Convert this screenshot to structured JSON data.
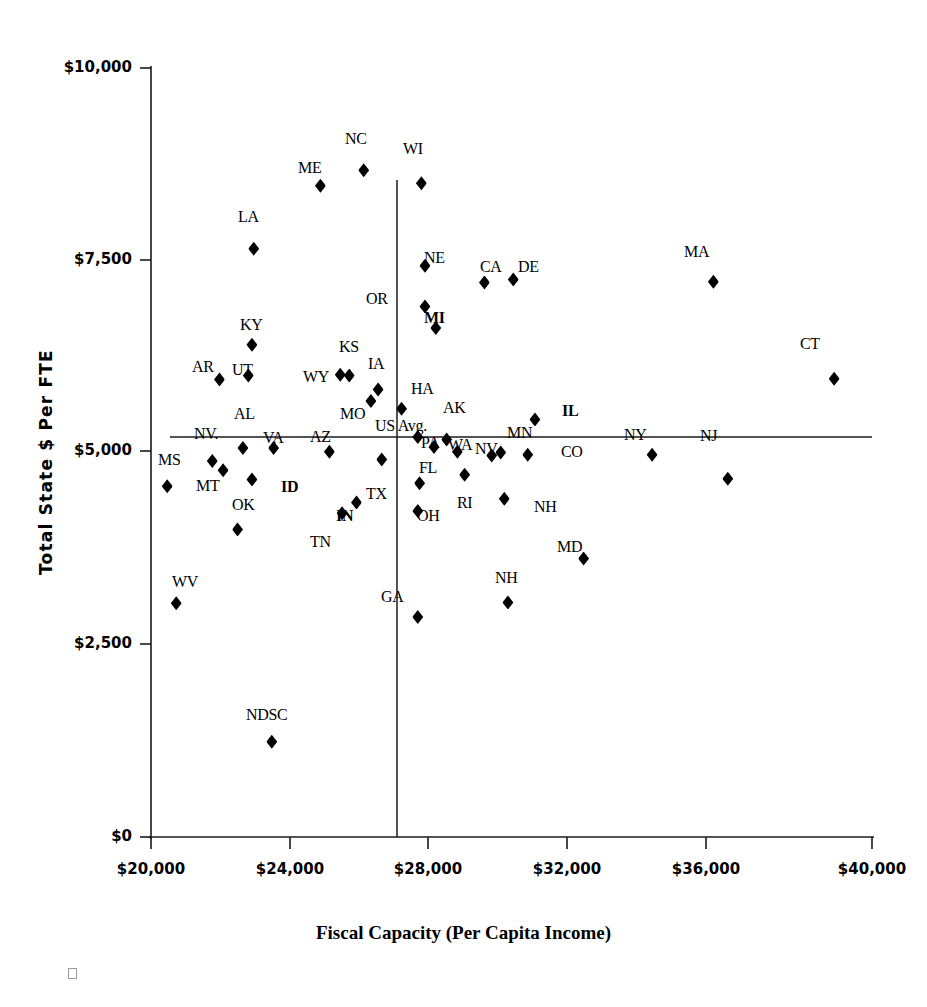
{
  "chart_data": {
    "type": "scatter",
    "title": "",
    "xlabel": "Fiscal Capacity (Per Capita Income)",
    "ylabel": "Total State $ Per FTE",
    "xlim": [
      20000,
      40000
    ],
    "ylim": [
      0,
      10000
    ],
    "xticks": [
      "$20,000",
      "$24,000",
      "$28,000",
      "$32,000",
      "$36,000",
      "$40,000"
    ],
    "xtick_values": [
      20000,
      24000,
      28000,
      32000,
      36000,
      40000
    ],
    "yticks": [
      "$0",
      "$2,500",
      "$5,000",
      "$7,500",
      "$10,000"
    ],
    "ytick_values": [
      0,
      2500,
      5000,
      7500,
      10000
    ],
    "grid": false,
    "legend": "none",
    "reference_lines": {
      "vertical_x": 27400,
      "horizontal_y": 5200,
      "note": "US Avg. crosshair"
    },
    "points": [
      {
        "label": "MS",
        "x": 20450,
        "y": 4560
      },
      {
        "label": "WV",
        "x": 20700,
        "y": 3040
      },
      {
        "label": "MT",
        "x": 21700,
        "y": 4890
      },
      {
        "label": "AR",
        "x": 21900,
        "y": 5950
      },
      {
        "label": "NV",
        "x": 22000,
        "y": 4770
      },
      {
        "label": "OK",
        "x": 22400,
        "y": 4000
      },
      {
        "label": "AL",
        "x": 22550,
        "y": 5060
      },
      {
        "label": "UT",
        "x": 22700,
        "y": 6000
      },
      {
        "label": "ID",
        "x": 22800,
        "y": 4650
      },
      {
        "label": "KY",
        "x": 22800,
        "y": 6400
      },
      {
        "label": "LA",
        "x": 22850,
        "y": 7650
      },
      {
        "label": "NDSC",
        "x": 23350,
        "y": 1240
      },
      {
        "label": "VA",
        "x": 23400,
        "y": 5060
      },
      {
        "label": "ME",
        "x": 24700,
        "y": 8470
      },
      {
        "label": "AZ",
        "x": 24950,
        "y": 5010
      },
      {
        "label": "WY",
        "x": 25250,
        "y": 6010
      },
      {
        "label": "TN",
        "x": 25300,
        "y": 4210
      },
      {
        "label": "KS",
        "x": 25500,
        "y": 6000
      },
      {
        "label": "IN",
        "x": 25700,
        "y": 4350
      },
      {
        "label": "NC",
        "x": 25900,
        "y": 8670
      },
      {
        "label": "MO",
        "x": 26100,
        "y": 5670
      },
      {
        "label": "IA",
        "x": 26300,
        "y": 5820
      },
      {
        "label": "TX",
        "x": 26400,
        "y": 4910
      },
      {
        "label": "HA",
        "x": 26950,
        "y": 5570
      },
      {
        "label": "US Avg.",
        "x": 27400,
        "y": 5200
      },
      {
        "label": "OH",
        "x": 27400,
        "y": 4240
      },
      {
        "label": "GA",
        "x": 27400,
        "y": 2860
      },
      {
        "label": "FL",
        "x": 27450,
        "y": 4600
      },
      {
        "label": "WI",
        "x": 27500,
        "y": 8500
      },
      {
        "label": "NE",
        "x": 27600,
        "y": 7430
      },
      {
        "label": "OR",
        "x": 27600,
        "y": 6900
      },
      {
        "label": "PA",
        "x": 27850,
        "y": 5070
      },
      {
        "label": "MI",
        "x": 27900,
        "y": 6620
      },
      {
        "label": "AK",
        "x": 28200,
        "y": 5170
      },
      {
        "label": "WA",
        "x": 28500,
        "y": 5010
      },
      {
        "label": "RI",
        "x": 28700,
        "y": 4710
      },
      {
        "label": "CA",
        "x": 29250,
        "y": 7210
      },
      {
        "label": "NV",
        "x": 29450,
        "y": 4960
      },
      {
        "label": "MN",
        "x": 29700,
        "y": 5000
      },
      {
        "label": "NH",
        "x": 29800,
        "y": 4400
      },
      {
        "label": "DE",
        "x": 30050,
        "y": 7250
      },
      {
        "label": "NM",
        "x": 29900,
        "y": 3050
      },
      {
        "label": "CO",
        "x": 30450,
        "y": 4970
      },
      {
        "label": "IL",
        "x": 30650,
        "y": 5430
      },
      {
        "label": "MD",
        "x": 32000,
        "y": 3620
      },
      {
        "label": "NY",
        "x": 33900,
        "y": 4970
      },
      {
        "label": "NJ",
        "x": 36000,
        "y": 4660
      },
      {
        "label": "MA",
        "x": 35600,
        "y": 7220
      },
      {
        "label": "CT",
        "x": 38950,
        "y": 5960
      }
    ]
  },
  "labels_placement": [
    {
      "text": "MS",
      "lx": 158,
      "ly": 452,
      "bold": false
    },
    {
      "text": "MT",
      "lx": 196,
      "ly": 478,
      "bold": false
    },
    {
      "text": "WV",
      "lx": 172,
      "ly": 574,
      "bold": false
    },
    {
      "text": "AR",
      "lx": 192,
      "ly": 359,
      "bold": false
    },
    {
      "text": "NV.",
      "lx": 194,
      "ly": 426,
      "bold": false
    },
    {
      "text": "AL",
      "lx": 234,
      "ly": 406,
      "bold": false
    },
    {
      "text": "UT",
      "lx": 232,
      "ly": 362,
      "bold": false
    },
    {
      "text": "KY",
      "lx": 240,
      "ly": 317,
      "bold": false
    },
    {
      "text": "LA",
      "lx": 238,
      "ly": 209,
      "bold": false
    },
    {
      "text": "OK",
      "lx": 232,
      "ly": 497,
      "bold": false
    },
    {
      "text": "ID",
      "lx": 281,
      "ly": 479,
      "bold": true
    },
    {
      "text": "VA",
      "lx": 263,
      "ly": 430,
      "bold": false
    },
    {
      "text": "NDSC",
      "lx": 246,
      "ly": 707,
      "bold": false
    },
    {
      "text": "AZ",
      "lx": 310,
      "ly": 429,
      "bold": false
    },
    {
      "text": "ME",
      "lx": 298,
      "ly": 160,
      "bold": false
    },
    {
      "text": "WY",
      "lx": 303,
      "ly": 369,
      "bold": false
    },
    {
      "text": "TN",
      "lx": 310,
      "ly": 534,
      "bold": false
    },
    {
      "text": "KS",
      "lx": 339,
      "ly": 339,
      "bold": false
    },
    {
      "text": "IN",
      "lx": 336,
      "ly": 508,
      "bold": true
    },
    {
      "text": "NC",
      "lx": 345,
      "ly": 131,
      "bold": false
    },
    {
      "text": "MO",
      "lx": 340,
      "ly": 406,
      "bold": false
    },
    {
      "text": "IA",
      "lx": 368,
      "ly": 356,
      "bold": false
    },
    {
      "text": "TX",
      "lx": 366,
      "ly": 486,
      "bold": false
    },
    {
      "text": "WI",
      "lx": 403,
      "ly": 141,
      "bold": false
    },
    {
      "text": "HA",
      "lx": 411,
      "ly": 381,
      "bold": false
    },
    {
      "text": "US Avg.",
      "lx": 375,
      "ly": 418,
      "bold": false
    },
    {
      "text": "NE",
      "lx": 424,
      "ly": 250,
      "bold": false
    },
    {
      "text": "OR",
      "lx": 366,
      "ly": 291,
      "bold": false
    },
    {
      "text": "MI",
      "lx": 424,
      "ly": 310,
      "bold": true
    },
    {
      "text": "PA",
      "lx": 421,
      "ly": 435,
      "bold": false
    },
    {
      "text": "FL",
      "lx": 419,
      "ly": 460,
      "bold": false
    },
    {
      "text": "OH",
      "lx": 417,
      "ly": 508,
      "bold": false
    },
    {
      "text": "GA",
      "lx": 381,
      "ly": 589,
      "bold": false
    },
    {
      "text": "AK",
      "lx": 443,
      "ly": 400,
      "bold": false
    },
    {
      "text": "WA",
      "lx": 448,
      "ly": 437,
      "bold": false
    },
    {
      "text": "NV",
      "lx": 475,
      "ly": 441,
      "bold": false
    },
    {
      "text": "RI",
      "lx": 457,
      "ly": 495,
      "bold": false
    },
    {
      "text": "CA",
      "lx": 480,
      "ly": 259,
      "bold": false
    },
    {
      "text": "DE",
      "lx": 518,
      "ly": 259,
      "bold": false
    },
    {
      "text": "MN",
      "lx": 507,
      "ly": 425,
      "bold": false
    },
    {
      "text": "NH",
      "lx": 534,
      "ly": 499,
      "bold": false
    },
    {
      "text": "NH",
      "lx": 495,
      "ly": 570,
      "bold": false
    },
    {
      "text": "CO",
      "lx": 561,
      "ly": 444,
      "bold": false
    },
    {
      "text": "IL",
      "lx": 562,
      "ly": 403,
      "bold": true
    },
    {
      "text": "MD",
      "lx": 557,
      "ly": 539,
      "bold": false
    },
    {
      "text": "NY",
      "lx": 624,
      "ly": 427,
      "bold": false
    },
    {
      "text": "NJ",
      "lx": 700,
      "ly": 428,
      "bold": false
    },
    {
      "text": "MA",
      "lx": 684,
      "ly": 244,
      "bold": false
    },
    {
      "text": "CT",
      "lx": 800,
      "ly": 336,
      "bold": false
    }
  ],
  "ytick_labels": [
    {
      "text": "$10,000",
      "ly": 68
    },
    {
      "text": "$7,500",
      "ly": 260
    },
    {
      "text": "$5,000",
      "ly": 451
    },
    {
      "text": "$2,500",
      "ly": 644
    },
    {
      "text": "$0",
      "ly": 837
    }
  ],
  "xtick_labels": [
    {
      "text": "$20,000",
      "lx": 151
    },
    {
      "text": "$24,000",
      "lx": 290
    },
    {
      "text": "$28,000",
      "lx": 428
    },
    {
      "text": "$32,000",
      "lx": 567
    },
    {
      "text": "$36,000",
      "lx": 706
    },
    {
      "text": "$40,000",
      "lx": 872
    }
  ]
}
